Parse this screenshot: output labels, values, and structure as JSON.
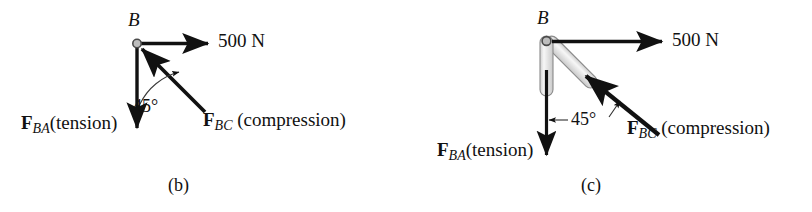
{
  "figure": {
    "background": "#ffffff",
    "ink": "#111111",
    "member_fill": "#e8e8e8",
    "member_stroke": "#6b6b6b",
    "pin_fill": "#bdbdbd",
    "pin_stroke": "#4a4a4a"
  },
  "panels": [
    {
      "id": "b",
      "caption": "(b)",
      "node_label": "B",
      "applied_load": "500 N",
      "angle_label": "45°",
      "forces": [
        {
          "name": "F_BA",
          "symbol": "F",
          "subscript": "BA",
          "qualifier": "(tension)",
          "text": "F_BA(tension)",
          "direction": "down"
        },
        {
          "name": "F_BC",
          "symbol": "F",
          "subscript": "BC",
          "qualifier": " (compression)",
          "text": "F_BC (compression)",
          "direction": "up-left"
        }
      ]
    },
    {
      "id": "c",
      "caption": "(c)",
      "node_label": "B",
      "applied_load": "500 N",
      "angle_label": "45°",
      "forces": [
        {
          "name": "F_BA",
          "symbol": "F",
          "subscript": "BA",
          "qualifier": "(tension)",
          "text": "F_BA(tension)",
          "direction": "down"
        },
        {
          "name": "F_BC",
          "symbol": "F",
          "subscript": "BC",
          "qualifier": " (compression)",
          "text": "F_BC (compression)",
          "direction": "up-left"
        }
      ]
    }
  ]
}
